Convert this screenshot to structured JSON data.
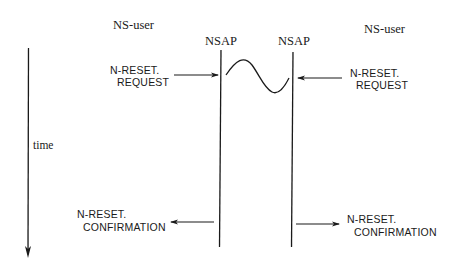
{
  "diagram": {
    "type": "time-sequence",
    "parties": {
      "left_user": "NS-user",
      "left_nsap": "NSAP",
      "right_nsap": "NSAP",
      "right_user": "NS-user"
    },
    "time_axis_label": "time",
    "primitives": {
      "left_request": {
        "line1": "N-RESET.",
        "line2": "REQUEST",
        "direction": "user-to-provider"
      },
      "right_request": {
        "line1": "N-RESET.",
        "line2": "REQUEST",
        "direction": "user-to-provider"
      },
      "left_confirmation": {
        "line1": "N-RESET.",
        "line2": "CONFIRMATION",
        "direction": "provider-to-user"
      },
      "right_confirmation": {
        "line1": "N-RESET.",
        "line2": "CONFIRMATION",
        "direction": "provider-to-user"
      }
    },
    "provider_interaction": "wave"
  },
  "colors": {
    "ink": "#1a1a1a",
    "background": "#ffffff"
  }
}
